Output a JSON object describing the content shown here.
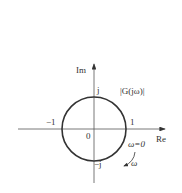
{
  "diagram": {
    "type": "nyquist-unit-circle",
    "axes": {
      "x_label": "Re",
      "y_label": "Im"
    },
    "origin_label": "0",
    "ticks": {
      "neg_one": "−1",
      "pos_one": "1",
      "pos_j": "j",
      "neg_j": "−j"
    },
    "curve_label": "|G(jω)|",
    "start_label": "ω=0",
    "direction_label": "ω",
    "colors": {
      "stroke": "#333333",
      "background": "#ffffff"
    }
  }
}
